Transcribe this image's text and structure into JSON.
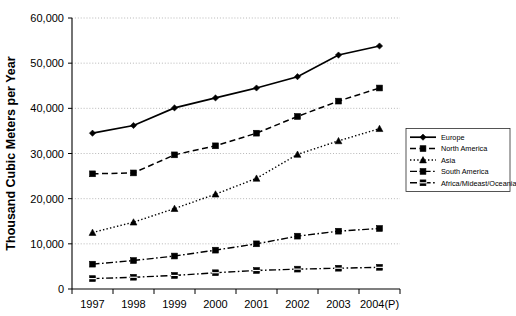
{
  "chart_data": {
    "type": "line",
    "title": "",
    "xlabel": "",
    "ylabel": "Thousand Cubic Meters per Year",
    "categories": [
      "1997",
      "1998",
      "1999",
      "2000",
      "2001",
      "2002",
      "2003",
      "2004(P)"
    ],
    "ylim": [
      0,
      60000
    ],
    "ytick_labels": [
      "0",
      "10,000",
      "20,000",
      "30,000",
      "40,000",
      "50,000",
      "60,000"
    ],
    "ytick_values": [
      0,
      10000,
      20000,
      30000,
      40000,
      50000,
      60000
    ],
    "grid": true,
    "legend_position": "right-middle",
    "series": [
      {
        "name": "Europe",
        "marker": "diamond",
        "dash": "solid",
        "values": [
          34500,
          36200,
          40100,
          42300,
          44500,
          47000,
          51800,
          53800
        ]
      },
      {
        "name": "North America",
        "marker": "square",
        "dash": "dashed",
        "values": [
          25500,
          25700,
          29700,
          31700,
          34500,
          38200,
          41600,
          44500
        ]
      },
      {
        "name": "Asia",
        "marker": "triangle",
        "dash": "dotted",
        "values": [
          12500,
          14800,
          17800,
          21000,
          24500,
          29800,
          32800,
          35500
        ]
      },
      {
        "name": "South America",
        "marker": "square",
        "dash": "dashdot",
        "values": [
          5500,
          6300,
          7300,
          8600,
          10000,
          11700,
          12800,
          13400
        ]
      },
      {
        "name": "Africa/Mideast/Oceania",
        "marker": "square-x",
        "dash": "dashdot",
        "values": [
          2300,
          2600,
          3000,
          3600,
          4100,
          4400,
          4600,
          4800
        ]
      }
    ]
  },
  "colors": {
    "ink": "#000000",
    "grid": "#9a9a9a",
    "background": "#ffffff"
  }
}
